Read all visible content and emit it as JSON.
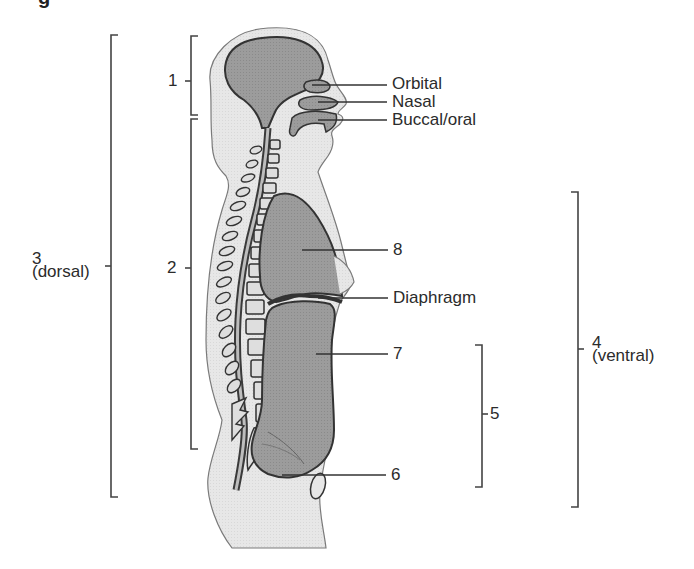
{
  "figure": {
    "caption_fragment": "g",
    "colors": {
      "skin": "#e6e6e6",
      "cavity": "#9a9a9a",
      "outline": "#3a3a3a",
      "bone": "#d9d9d9",
      "line": "#333333",
      "background": "#ffffff"
    },
    "labels": {
      "orbital": "Orbital",
      "nasal": "Nasal",
      "buccal_oral": "Buccal/oral",
      "diaphragm": "Diaphragm",
      "n1": "1",
      "n2": "2",
      "n3": "3",
      "n3_sub": "(dorsal)",
      "n4": "4",
      "n4_sub": "(ventral)",
      "n5": "5",
      "n6": "6",
      "n7": "7",
      "n8": "8"
    },
    "brackets": [
      {
        "id": "1",
        "x": 191,
        "y1": 36,
        "y2": 115,
        "side": "left"
      },
      {
        "id": "2",
        "x": 191,
        "y1": 119,
        "y2": 449,
        "side": "left"
      },
      {
        "id": "3",
        "x": 111,
        "y1": 35,
        "y2": 497,
        "side": "left"
      },
      {
        "id": "4",
        "x": 578,
        "y1": 192,
        "y2": 507,
        "side": "right"
      },
      {
        "id": "5",
        "x": 482,
        "y1": 345,
        "y2": 487,
        "side": "right"
      }
    ]
  }
}
